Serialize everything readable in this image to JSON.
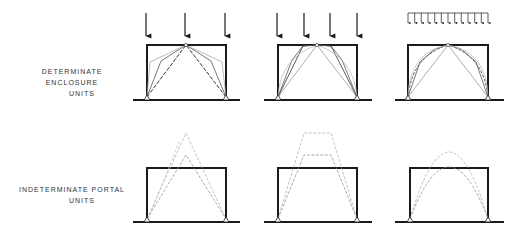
{
  "rows": [
    {
      "label_line1": "DETERMINATE   ENCLOSURE",
      "label_line2": "UNITS",
      "type": "determinate-enclosure",
      "units": [
        {
          "load": "three point loads"
        },
        {
          "load": "four point loads"
        },
        {
          "load": "uniformly distributed load"
        }
      ]
    },
    {
      "label_line1": "INDETERMINATE   PORTAL",
      "label_line2": "UNITS",
      "type": "indeterminate-portal",
      "units": [
        {
          "shape": "triangular"
        },
        {
          "shape": "trapezoidal"
        },
        {
          "shape": "parabolic"
        }
      ]
    }
  ],
  "colors": {
    "frame": "#1a1a1a",
    "thrust_line_light": "#9a9a9a",
    "thrust_line_dark": "#333333"
  }
}
